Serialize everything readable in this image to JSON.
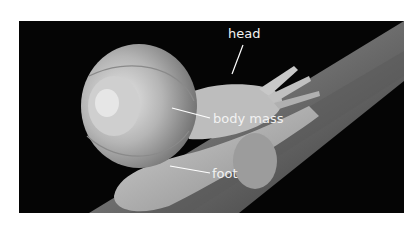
{
  "figure": {
    "labels": [
      {
        "id": "head",
        "text": "head"
      },
      {
        "id": "body_mass",
        "text": "body mass"
      },
      {
        "id": "foot",
        "text": "foot"
      }
    ]
  }
}
